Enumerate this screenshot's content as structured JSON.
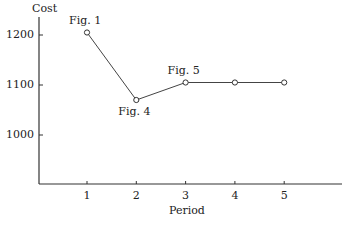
{
  "chart_data": {
    "type": "line",
    "title": "",
    "xlabel": "Period",
    "ylabel": "Cost",
    "x": [
      1,
      2,
      3,
      4,
      5
    ],
    "series": [
      {
        "name": "Cost",
        "values": [
          1205,
          1070,
          1105,
          1105,
          1105
        ]
      }
    ],
    "x_ticks": [
      "1",
      "2",
      "3",
      "4",
      "5"
    ],
    "y_ticks": [
      "1000",
      "1100",
      "1200"
    ],
    "ylim": [
      900,
      1260
    ],
    "xlim": [
      0,
      6.2
    ],
    "grid": false,
    "annotations": [
      {
        "text": "Fig. 1",
        "x": 1,
        "y": 1205,
        "position": "above"
      },
      {
        "text": "Fig. 4",
        "x": 2,
        "y": 1070,
        "position": "below"
      },
      {
        "text": "Fig. 5",
        "x": 3,
        "y": 1105,
        "position": "above"
      }
    ],
    "marker": "open-circle"
  },
  "axes": {
    "ylabel": "Cost",
    "xlabel": "Period"
  }
}
